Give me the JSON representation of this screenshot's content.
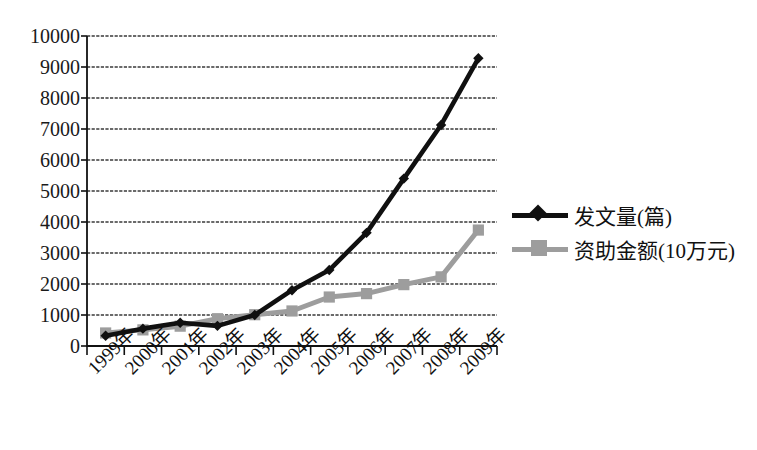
{
  "chart_data": {
    "type": "line",
    "title": "",
    "xlabel": "",
    "ylabel": "",
    "grid": true,
    "legend_position": "right",
    "ylim": [
      0,
      10000
    ],
    "ytick_values": [
      0,
      1000,
      2000,
      3000,
      4000,
      5000,
      6000,
      7000,
      8000,
      9000,
      10000
    ],
    "ytick_labels": [
      "0",
      "1000",
      "2000",
      "3000",
      "4000",
      "5000",
      "6000",
      "7000",
      "8000",
      "9000",
      "10000"
    ],
    "categories": [
      "1999年",
      "2000年",
      "2001年",
      "2002年",
      "2003年",
      "2004年",
      "2005年",
      "2006年",
      "2007年",
      "2008年",
      "2009年"
    ],
    "series": [
      {
        "name": "发文量(篇)",
        "color": "#101010",
        "marker": "diamond",
        "values": [
          330,
          560,
          750,
          650,
          1000,
          1800,
          2450,
          3650,
          5400,
          7130,
          9280
        ]
      },
      {
        "name": "资助金额(10万元)",
        "color": "#9d9d9d",
        "marker": "square",
        "values": [
          420,
          520,
          640,
          880,
          1010,
          1130,
          1580,
          1690,
          1980,
          2230,
          3740
        ]
      }
    ]
  },
  "legend": {
    "items": [
      {
        "label": "发文量(篇)",
        "marker": "diamond-marker-icon",
        "color": "#101010"
      },
      {
        "label": "资助金额(10万元)",
        "marker": "square-marker-icon",
        "color": "#9d9d9d"
      }
    ]
  },
  "axes": {
    "plot_left": 87,
    "plot_right": 497,
    "plot_top": 36,
    "plot_bottom": 346
  }
}
